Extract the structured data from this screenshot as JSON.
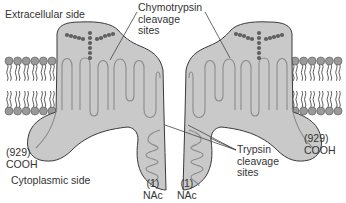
{
  "diagram": {
    "colors": {
      "protein_fill": "#c9c9c9",
      "protein_stroke": "#3a3a3a",
      "loop_stroke": "#8a8a8a",
      "dot_fill": "#5f5f5f",
      "lipid_head": "#9a9a9a",
      "lipid_tail": "#333333",
      "text": "#333333",
      "leader_line": "#444444"
    },
    "labels": {
      "extracellular": "Extracellular side",
      "cytoplasmic": "Cytoplasmic side",
      "chymotrypsin": [
        "Chymotrypsin",
        "cleavage",
        "sites"
      ],
      "trypsin": [
        "Trypsin",
        "cleavage",
        "sites"
      ],
      "left_c_terminus": [
        "(929)",
        "COOH"
      ],
      "right_c_terminus": [
        "(929)",
        "COOH"
      ],
      "left_n_terminus": [
        "(1)",
        "NAc"
      ],
      "right_n_terminus": [
        "(1)",
        "NAc"
      ]
    },
    "membrane": {
      "left_heads_per_row": 6,
      "right_heads_per_row": 6
    }
  }
}
